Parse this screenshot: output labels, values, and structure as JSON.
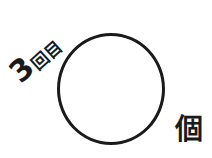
{
  "count_label": {
    "number": "3",
    "suffix": "回目"
  },
  "answer_circle": {
    "value": ""
  },
  "unit": "個",
  "colors": {
    "ink": "#1a1a1a",
    "background": "#ffffff"
  }
}
